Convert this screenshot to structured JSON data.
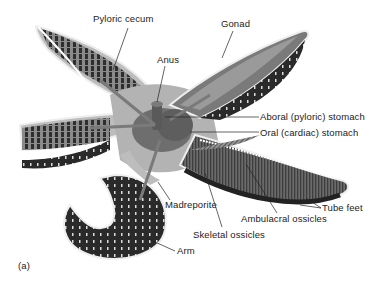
{
  "figure": {
    "panel_label": "(a)",
    "labels": {
      "pyloric_cecum": "Pyloric cecum",
      "gonad": "Gonad",
      "anus": "Anus",
      "aboral_stomach": "Aboral (pyloric) stomach",
      "oral_stomach": "Oral (cardiac) stomach",
      "madreporite": "Madreporite",
      "ambulacral_ossicles": "Ambulacral ossicles",
      "tube_feet": "Tube feet",
      "skeletal_ossicles": "Skeletal ossicles",
      "arm": "Arm"
    }
  }
}
